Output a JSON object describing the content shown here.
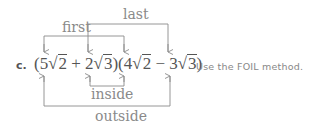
{
  "problem": {
    "part_label": "c.",
    "expression": {
      "open1": "(5",
      "rad1": "2",
      "plus": " + 2",
      "rad2": "3",
      "mid": ")(4",
      "rad3": "2",
      "minus": " − 3",
      "rad4": "3",
      "close": ")"
    },
    "radical_symbol": "√",
    "note": "Use the FOIL method."
  },
  "annotations": {
    "first": "first",
    "last": "last",
    "inside": "inside",
    "outside": "outside"
  },
  "colors": {
    "arrow": "#8a8a8a",
    "text": "#555555",
    "label": "#8a8a8a"
  }
}
